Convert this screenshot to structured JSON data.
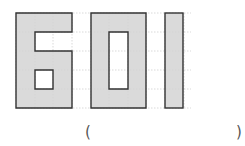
{
  "figure": {
    "digits": [
      "6",
      "0",
      "1"
    ],
    "grid": {
      "origin_x": 16,
      "origin_y": 13,
      "cell": 18.9,
      "cols": 10,
      "rows": 5
    },
    "fill_color": "#d3d3d3",
    "stroke_color": "#333333",
    "grid_color": "#cfcfcf"
  },
  "answer": {
    "open_paren": "(",
    "close_paren": ")",
    "value": ""
  }
}
